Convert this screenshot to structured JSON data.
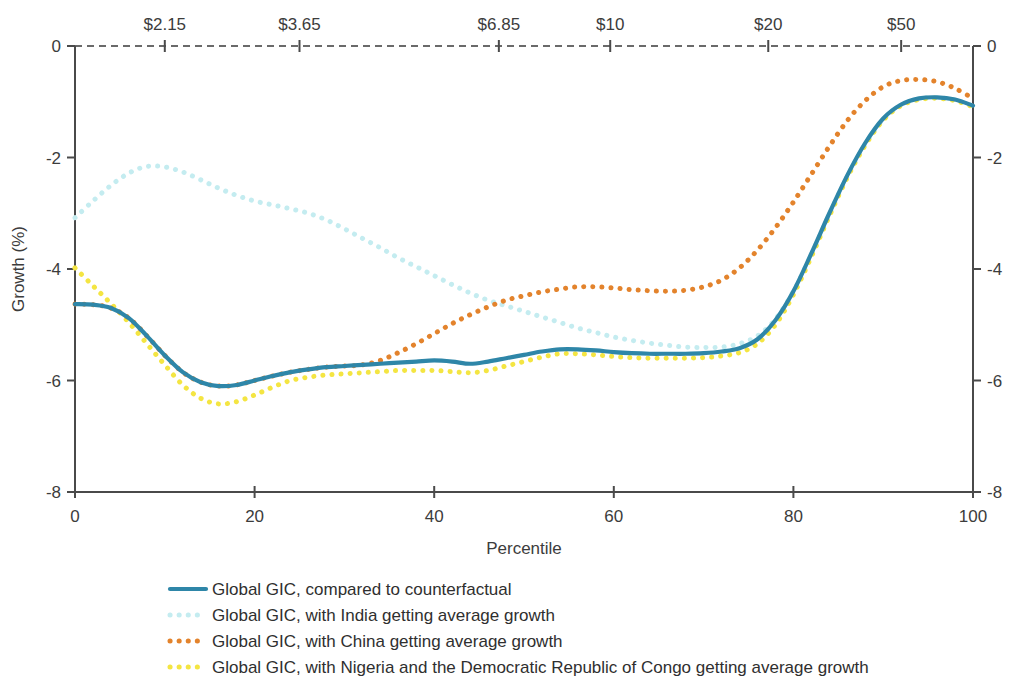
{
  "chart_data": {
    "type": "line",
    "title": "",
    "xlabel": "Percentile",
    "ylabel": "Growth (%)",
    "xlim": [
      0,
      100
    ],
    "ylim": [
      -8,
      0
    ],
    "grid": false,
    "legend_position": "bottom",
    "x_ticks": [
      "0",
      "20",
      "40",
      "60",
      "80",
      "100"
    ],
    "x_tick_values": [
      0,
      20,
      40,
      60,
      80,
      100
    ],
    "y_ticks": [
      "0",
      "-2",
      "-4",
      "-6",
      "-8"
    ],
    "y_tick_values": [
      0,
      -2,
      -4,
      -6,
      -8
    ],
    "y_ticks_right": [
      "0",
      "-2",
      "-4",
      "-6",
      "-8"
    ],
    "top_axis": {
      "label": "",
      "ticks": [
        "$2.15",
        "$3.65",
        "$6.85",
        "$10",
        "$20",
        "$50"
      ],
      "tick_percentiles": [
        10.0,
        25.0,
        47.2,
        59.6,
        77.2,
        92.0
      ]
    },
    "x": [
      0,
      2,
      4,
      6,
      8,
      10,
      12,
      14,
      16,
      18,
      20,
      22,
      24,
      26,
      28,
      30,
      32,
      34,
      36,
      38,
      40,
      42,
      44,
      46,
      48,
      50,
      52,
      54,
      56,
      58,
      60,
      62,
      64,
      66,
      68,
      70,
      72,
      74,
      76,
      78,
      80,
      82,
      84,
      86,
      88,
      90,
      92,
      94,
      96,
      98,
      100
    ],
    "series": [
      {
        "name": "Global GIC, compared to counterfactual",
        "color": "#2e86a8",
        "style": "solid",
        "values": [
          -4.63,
          -4.64,
          -4.7,
          -4.88,
          -5.2,
          -5.55,
          -5.85,
          -6.03,
          -6.1,
          -6.08,
          -6.0,
          -5.92,
          -5.85,
          -5.8,
          -5.76,
          -5.74,
          -5.72,
          -5.7,
          -5.68,
          -5.66,
          -5.64,
          -5.66,
          -5.7,
          -5.66,
          -5.6,
          -5.54,
          -5.48,
          -5.44,
          -5.44,
          -5.46,
          -5.49,
          -5.51,
          -5.52,
          -5.52,
          -5.52,
          -5.51,
          -5.48,
          -5.42,
          -5.26,
          -4.92,
          -4.4,
          -3.72,
          -3.0,
          -2.32,
          -1.74,
          -1.3,
          -1.05,
          -0.94,
          -0.92,
          -0.96,
          -1.07
        ]
      },
      {
        "name": "Global GIC, with India getting average growth",
        "color": "#c4ecf0",
        "style": "dotted",
        "values": [
          -3.08,
          -2.78,
          -2.5,
          -2.28,
          -2.16,
          -2.17,
          -2.26,
          -2.4,
          -2.55,
          -2.68,
          -2.78,
          -2.85,
          -2.92,
          -3.0,
          -3.12,
          -3.28,
          -3.45,
          -3.62,
          -3.8,
          -3.96,
          -4.12,
          -4.28,
          -4.43,
          -4.56,
          -4.66,
          -4.76,
          -4.86,
          -4.96,
          -5.06,
          -5.14,
          -5.22,
          -5.28,
          -5.33,
          -5.37,
          -5.4,
          -5.41,
          -5.4,
          -5.34,
          -5.2,
          -4.9,
          -4.4,
          -3.74,
          -3.02,
          -2.34,
          -1.76,
          -1.32,
          -1.06,
          -0.95,
          -0.93,
          -0.97,
          -1.08
        ]
      },
      {
        "name": "Global GIC, with China getting average growth",
        "color": "#e3832c",
        "style": "dotted",
        "values": [
          -4.63,
          -4.64,
          -4.7,
          -4.88,
          -5.2,
          -5.55,
          -5.85,
          -6.03,
          -6.1,
          -6.08,
          -6.0,
          -5.92,
          -5.85,
          -5.8,
          -5.76,
          -5.74,
          -5.72,
          -5.64,
          -5.5,
          -5.34,
          -5.16,
          -4.98,
          -4.82,
          -4.68,
          -4.56,
          -4.48,
          -4.41,
          -4.36,
          -4.32,
          -4.32,
          -4.34,
          -4.37,
          -4.39,
          -4.4,
          -4.38,
          -4.32,
          -4.2,
          -3.98,
          -3.66,
          -3.26,
          -2.8,
          -2.3,
          -1.8,
          -1.34,
          -0.98,
          -0.73,
          -0.62,
          -0.6,
          -0.64,
          -0.76,
          -0.94
        ]
      },
      {
        "name": "Global GIC, with Nigeria and the Democratic Republic of Congo getting average growth",
        "color": "#f4e542",
        "style": "dotted",
        "values": [
          -3.98,
          -4.3,
          -4.62,
          -4.96,
          -5.34,
          -5.72,
          -6.08,
          -6.32,
          -6.42,
          -6.38,
          -6.26,
          -6.12,
          -6.0,
          -5.94,
          -5.9,
          -5.88,
          -5.86,
          -5.84,
          -5.82,
          -5.82,
          -5.82,
          -5.84,
          -5.86,
          -5.82,
          -5.74,
          -5.66,
          -5.58,
          -5.52,
          -5.52,
          -5.54,
          -5.57,
          -5.59,
          -5.6,
          -5.6,
          -5.6,
          -5.59,
          -5.56,
          -5.5,
          -5.34,
          -5.0,
          -4.46,
          -3.78,
          -3.05,
          -2.36,
          -1.78,
          -1.33,
          -1.07,
          -0.96,
          -0.94,
          -0.98,
          -1.09
        ]
      }
    ]
  },
  "legend": {
    "items": [
      {
        "label": "Global GIC, compared to counterfactual",
        "color": "#2e86a8",
        "style": "solid"
      },
      {
        "label": "Global GIC, with India getting average growth",
        "color": "#c4ecf0",
        "style": "dotted"
      },
      {
        "label": "Global GIC, with China getting average growth",
        "color": "#e3832c",
        "style": "dotted"
      },
      {
        "label": "Global GIC, with Nigeria and the Democratic Republic of Congo getting average growth",
        "color": "#f4e542",
        "style": "dotted"
      }
    ]
  }
}
